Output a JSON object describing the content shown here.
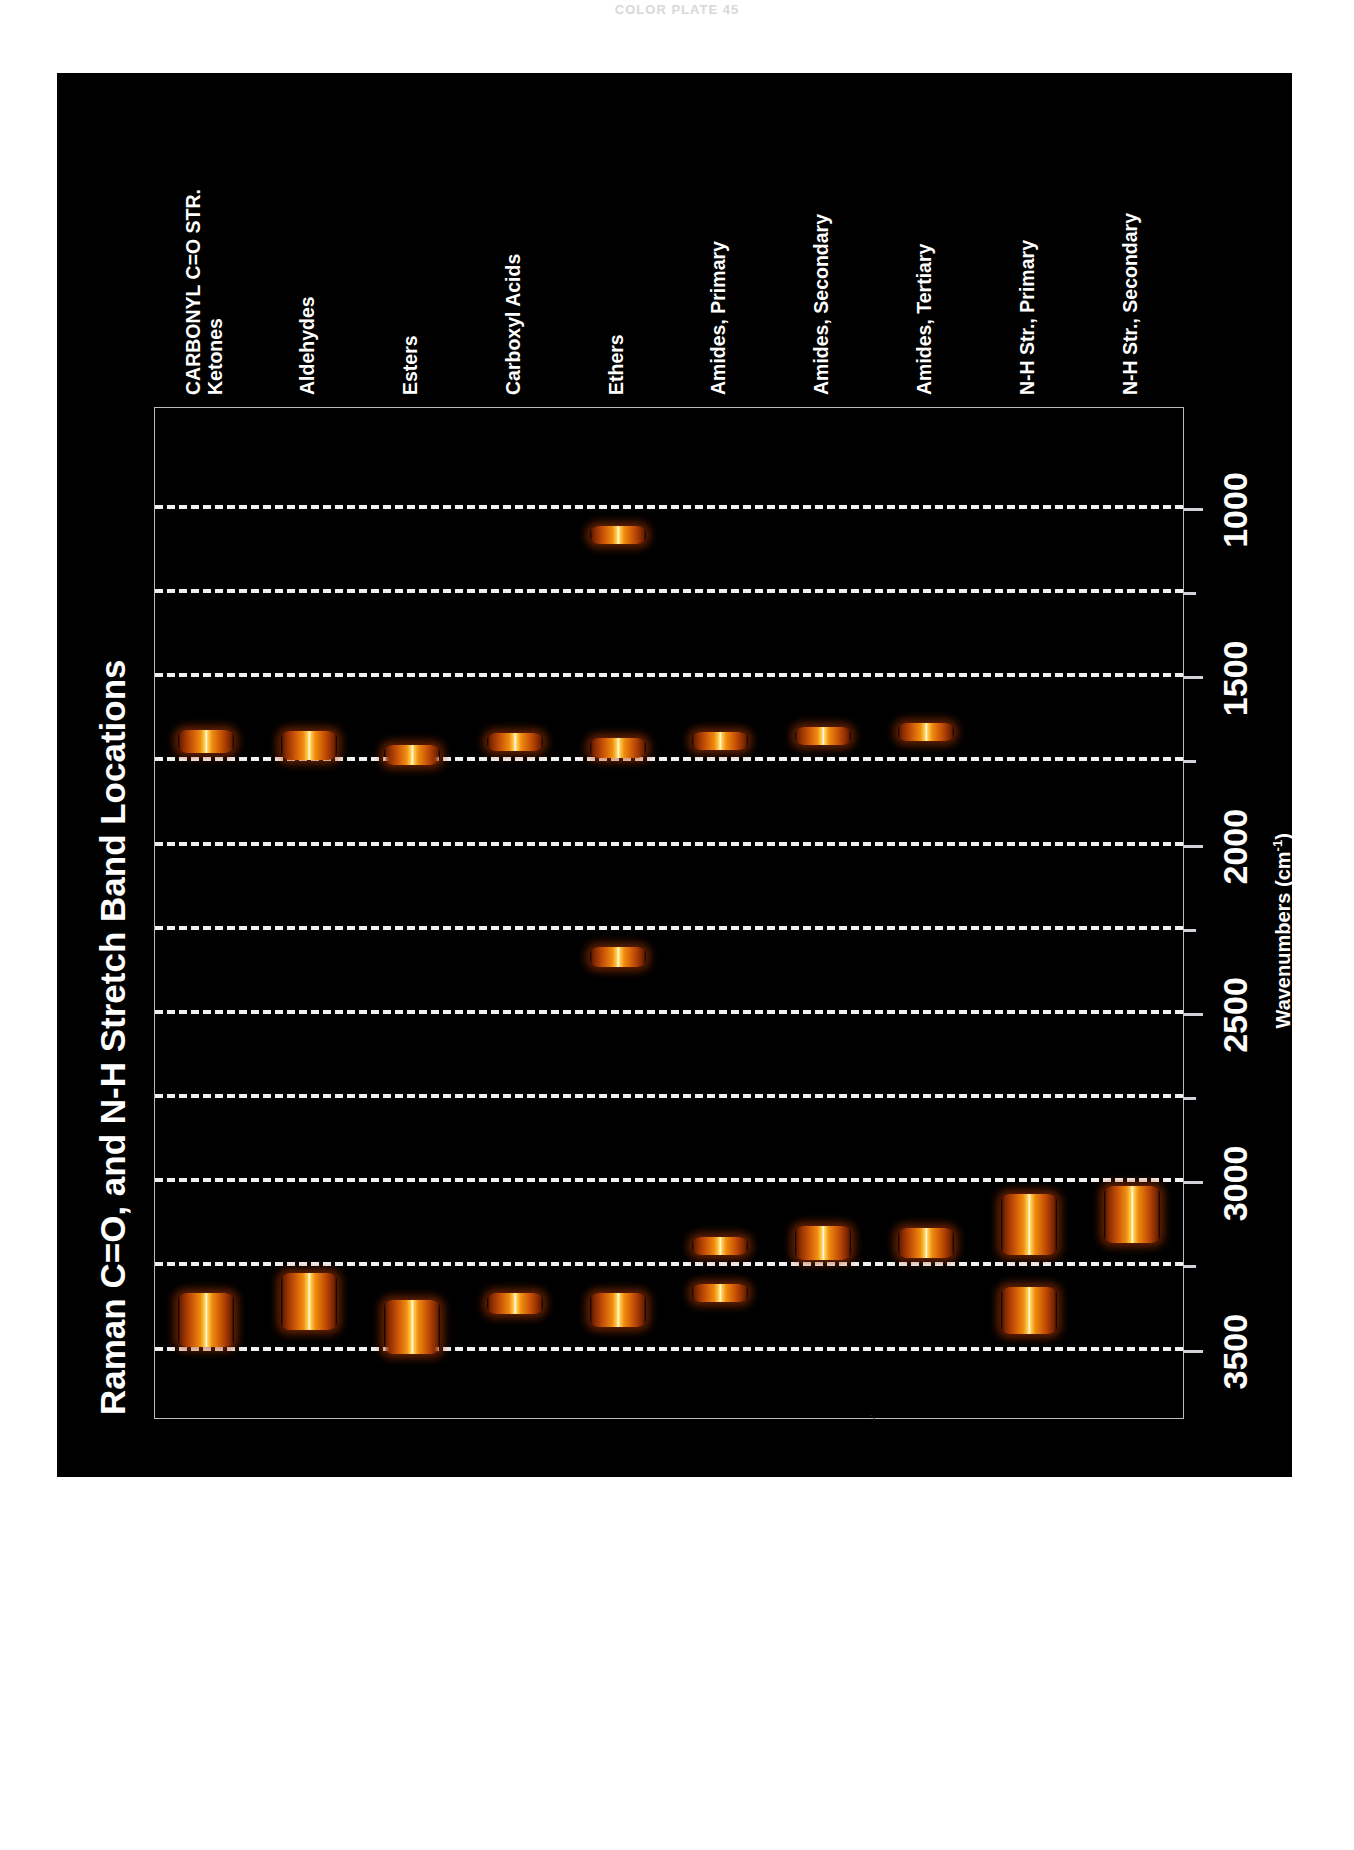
{
  "page": {
    "top_stub_text": "COLOR PLATE 45",
    "background_color": "#ffffff",
    "panel_color": "#000000"
  },
  "chart_data": {
    "type": "bar",
    "orientation": "horizontal-range-bands",
    "title": "Raman C=O, and N-H Stretch Band Locations",
    "xlabel": "Wavenumbers (cm⁻¹)",
    "ylabel": "",
    "axis_label_unit": "cm",
    "axis_label_unit_exponent": "-1",
    "xlim": [
      700,
      3700
    ],
    "axis_direction": "reversed-left-to-right",
    "grid": true,
    "grid_style": "dashed",
    "grid_color": "#f0f0f0",
    "legend": "none",
    "tick_labels": [
      "1000",
      "1500",
      "2000",
      "2500",
      "3000",
      "3500"
    ],
    "tick_values": [
      1000,
      1500,
      2000,
      2500,
      3000,
      3500
    ],
    "minor_tick_values": [
      1250,
      1750,
      2250,
      2750,
      3250
    ],
    "band_color_low": "#9d3403",
    "band_color_mid": "#f0910f",
    "band_color_peak": "#fffbe2",
    "categories": [
      "CARBONYL C=O STR.\nKetones",
      "Aldehydes",
      "Esters",
      "Carboxyl Acids",
      "Ethers",
      "Amides, Primary",
      "Amides, Secondary",
      "Amides, Tertiary",
      "N-H Str., Primary",
      "N-H Str., Secondary"
    ],
    "category_labels": [
      {
        "line1": "CARBONYL C=O STR.",
        "line2": "Ketones"
      },
      {
        "line1": "",
        "line2": "Aldehydes"
      },
      {
        "line1": "",
        "line2": "Esters"
      },
      {
        "line1": "",
        "line2": "Carboxyl Acids"
      },
      {
        "line1": "",
        "line2": "Ethers"
      },
      {
        "line1": "",
        "line2": "Amides, Primary"
      },
      {
        "line1": "",
        "line2": "Amides, Secondary"
      },
      {
        "line1": "",
        "line2": "Amides, Tertiary"
      },
      {
        "line1": "",
        "line2": "N-H Str., Primary"
      },
      {
        "line1": "",
        "line2": "N-H Str., Secondary"
      }
    ],
    "bands": [
      {
        "category": "Ketones",
        "ranges": [
          [
            1655,
            1725
          ],
          [
            3330,
            3490
          ]
        ]
      },
      {
        "category": "Aldehydes",
        "ranges": [
          [
            1660,
            1745
          ],
          [
            3270,
            3440
          ]
        ]
      },
      {
        "category": "Esters",
        "ranges": [
          [
            1700,
            1760
          ],
          [
            3350,
            3510
          ]
        ]
      },
      {
        "category": "Carboxyl Acids",
        "ranges": [
          [
            1670,
            1720
          ],
          [
            3330,
            3390
          ]
        ]
      },
      {
        "category": "Ethers",
        "ranges": [
          [
            1050,
            1105
          ],
          [
            2300,
            2360
          ],
          [
            1680,
            1740
          ],
          [
            3330,
            3430
          ]
        ]
      },
      {
        "category": "Amides, Primary",
        "ranges": [
          [
            1665,
            1715
          ],
          [
            3175,
            3215
          ],
          [
            3310,
            3355
          ]
        ]
      },
      {
        "category": "Amides, Secondary",
        "ranges": [
          [
            1650,
            1700
          ],
          [
            3130,
            3230
          ]
        ]
      },
      {
        "category": "Amides, Tertiary",
        "ranges": [
          [
            1645,
            1690
          ],
          [
            3135,
            3225
          ]
        ]
      },
      {
        "category": "N-H Str., Primary",
        "ranges": [
          [
            3035,
            3215
          ],
          [
            3310,
            3450
          ]
        ]
      },
      {
        "category": "N-H Str., Secondary",
        "ranges": [
          [
            3010,
            3180
          ]
        ]
      }
    ]
  }
}
